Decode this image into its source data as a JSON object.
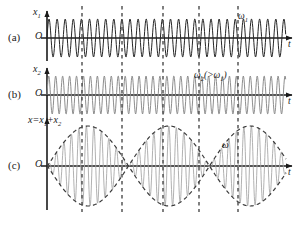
{
  "figure": {
    "width": 306,
    "height": 225,
    "background": "#ffffff",
    "stroke_dark": "#262626",
    "stroke_light": "#9a9a9a",
    "stroke_dashed": "#4a4a4a",
    "axis_color": "#1a1a1a"
  },
  "panels": [
    {
      "id": "a",
      "tag": "(a)",
      "y_label": "x",
      "y_label_sub": "1",
      "origin": "O",
      "t_label": "t",
      "freq_label": "ω",
      "freq_label_sub": "1",
      "baseline_y": 38,
      "axis_x": 47,
      "axis_end_x": 292,
      "amplitude": 19,
      "period_px": 8.1,
      "phase": 0,
      "wave_color": "#262626",
      "wave_width": 1.0
    },
    {
      "id": "b",
      "tag": "(b)",
      "y_label": "x",
      "y_label_sub": "2",
      "origin": "O",
      "t_label": "t",
      "freq_label": "ω",
      "freq_label_sub": "2",
      "freq_note": "(>ω",
      "freq_note_sub": "1",
      "freq_note_end": ")",
      "baseline_y": 95,
      "axis_x": 47,
      "axis_end_x": 292,
      "amplitude": 19,
      "period_px": 6.95,
      "phase": 0,
      "wave_color": "#8e8e8e",
      "wave_width": 1.0
    },
    {
      "id": "c",
      "tag": "(c)",
      "y_label": "x=x",
      "y_label_sub": "1",
      "y_label_mid": "+x",
      "y_label_sub2": "2",
      "origin": "O",
      "t_label": "t",
      "freq_label": "ω",
      "baseline_y": 166,
      "axis_x": 47,
      "axis_end_x": 292,
      "amplitude": 40,
      "period_px": 7.5,
      "beat_period_px": 81,
      "beat_phase_px": 41,
      "wave_color": "#a8a8a8",
      "envelope_color": "#3a3a3a",
      "wave_width": 0.9
    }
  ],
  "dashed_lines": {
    "label": "beat-marker-lines",
    "x_positions": [
      82,
      122,
      163,
      199,
      238
    ],
    "y_top": 6,
    "y_bottom": 212,
    "color": "#4a4a4a",
    "dash": "3.5,3.5",
    "width": 1.4
  },
  "chart_data": {
    "type": "line",
    "xlabel": "t",
    "ylabel": "x",
    "grid": false,
    "legend": false,
    "annotations": [
      "(a)",
      "(b)",
      "(c)",
      "ω₁",
      "ω₂(>ω₁)",
      "ω",
      "x₁",
      "x₂",
      "x=x₁+x₂",
      "O",
      "t"
    ],
    "series": [
      {
        "name": "x1",
        "panel": "a",
        "description": "Harmonic wave of angular frequency ω₁",
        "amplitude": 1.0,
        "angular_frequency_rel": 1.0,
        "cycles_shown": 30
      },
      {
        "name": "x2",
        "panel": "b",
        "description": "Harmonic wave of angular frequency ω₂ greater than ω₁",
        "amplitude": 1.0,
        "angular_frequency_rel": 1.166,
        "cycles_shown": 35
      },
      {
        "name": "x = x1 + x2",
        "panel": "c",
        "description": "Beat pattern: carrier at mean frequency ω with slow amplitude envelope",
        "amplitude": 2.0,
        "angular_frequency_rel": 1.083,
        "beat_nodes_t": [
          82,
          163,
          238
        ],
        "beat_antinodes_t": [
          122,
          199
        ],
        "envelope": "dashed"
      }
    ],
    "markers": {
      "name": "vertical dashed alignment lines",
      "x": [
        82,
        122,
        163,
        199,
        238
      ]
    }
  }
}
